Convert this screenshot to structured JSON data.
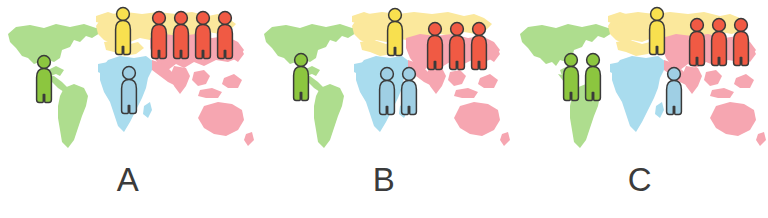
{
  "figure": {
    "background_color": "#ffffff",
    "width": 768,
    "height": 218
  },
  "map": {
    "regions": [
      {
        "name": "americas",
        "color": "#aedd8e",
        "label": "Americas"
      },
      {
        "name": "europe-russia",
        "color": "#fbe89c",
        "label": "Europe and Northern Asia"
      },
      {
        "name": "africa",
        "color": "#a9dcee",
        "label": "Africa"
      },
      {
        "name": "asia-oceania",
        "color": "#f6a6b1",
        "label": "Asia and Oceania"
      }
    ]
  },
  "legend_colors": {
    "green_figure": "#8cc63f",
    "yellow_figure": "#f8e04f",
    "blue_figure": "#9fcfe4",
    "red_figure": "#f05a44",
    "figure_outline": "#3a3a3a"
  },
  "panels": [
    {
      "id": "panel-a",
      "label": "A",
      "x": 0,
      "groups": [
        {
          "name": "americas-group",
          "color_key": "green_figure",
          "count": 1,
          "x": 33,
          "y": 54
        },
        {
          "name": "europe-group",
          "color_key": "yellow_figure",
          "count": 1,
          "x": 112,
          "y": 6
        },
        {
          "name": "africa-group",
          "color_key": "blue_figure",
          "count": 1,
          "x": 118,
          "y": 65
        },
        {
          "name": "asia-group",
          "color_key": "red_figure",
          "count": 4,
          "x": 148,
          "y": 10
        }
      ]
    },
    {
      "id": "panel-b",
      "label": "B",
      "x": 256,
      "groups": [
        {
          "name": "americas-group",
          "color_key": "green_figure",
          "count": 1,
          "x": 290,
          "y": 52
        },
        {
          "name": "europe-group",
          "color_key": "yellow_figure",
          "count": 1,
          "x": 384,
          "y": 7
        },
        {
          "name": "africa-group",
          "color_key": "blue_figure",
          "count": 2,
          "x": 376,
          "y": 66
        },
        {
          "name": "asia-group",
          "color_key": "red_figure",
          "count": 3,
          "x": 424,
          "y": 21
        }
      ]
    },
    {
      "id": "panel-c",
      "label": "C",
      "x": 512,
      "groups": [
        {
          "name": "americas-group",
          "color_key": "green_figure",
          "count": 2,
          "x": 560,
          "y": 52
        },
        {
          "name": "europe-group",
          "color_key": "yellow_figure",
          "count": 1,
          "x": 646,
          "y": 6
        },
        {
          "name": "africa-group",
          "color_key": "blue_figure",
          "count": 1,
          "x": 663,
          "y": 66
        },
        {
          "name": "asia-group",
          "color_key": "red_figure",
          "count": 3,
          "x": 686,
          "y": 17
        }
      ]
    }
  ],
  "chart_data": {
    "type": "pictogram",
    "categories": [
      "A",
      "B",
      "C"
    ],
    "unit": "one figure icon",
    "legend": [
      "Americas (green)",
      "Europe/Northern Asia (yellow)",
      "Africa (blue)",
      "Asia (red)"
    ],
    "series": [
      {
        "name": "Americas (green)",
        "values": [
          1,
          1,
          2
        ]
      },
      {
        "name": "Europe/Northern Asia (yellow)",
        "values": [
          1,
          1,
          1
        ]
      },
      {
        "name": "Africa (blue)",
        "values": [
          1,
          2,
          1
        ]
      },
      {
        "name": "Asia (red)",
        "values": [
          4,
          3,
          3
        ]
      }
    ],
    "totals": [
      7,
      7,
      7
    ],
    "xlabel": "",
    "ylabel": "",
    "grid": false,
    "legend_position": "none"
  }
}
